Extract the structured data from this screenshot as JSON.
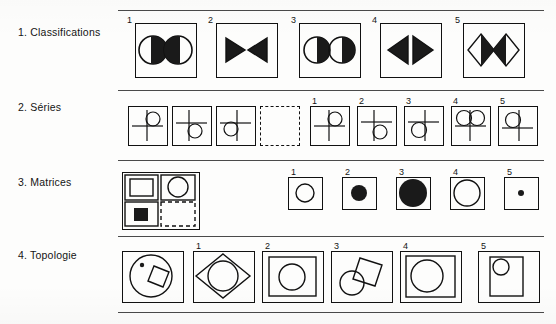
{
  "page": {
    "background_color": "#fdfdfc",
    "ink_color": "#111111",
    "fill_color": "#1a1a1a"
  },
  "rows": [
    {
      "id": "classifications",
      "label": "1. Classifications",
      "stimulus": null,
      "option_numbers": [
        "1",
        "2",
        "3",
        "4",
        "5"
      ],
      "options": [
        {
          "number": "1",
          "description": "two circles, left half-filled on right side, right half-filled on left side (mirror)",
          "shape": "circle",
          "arrangement": "mirror"
        },
        {
          "number": "2",
          "description": "two filled triangles pointing toward each other",
          "shape": "triangle",
          "arrangement": "mirror"
        },
        {
          "number": "3",
          "description": "two circles both filled on the right half (translation)",
          "shape": "circle",
          "arrangement": "translation"
        },
        {
          "number": "4",
          "description": "two triangles filled, apexes pointing outward",
          "shape": "triangle",
          "arrangement": "mirror-outward"
        },
        {
          "number": "5",
          "description": "two diamonds with opposite halves filled (mirror)",
          "shape": "diamond",
          "arrangement": "mirror"
        }
      ]
    },
    {
      "id": "series",
      "label": "2. Séries",
      "stimulus": {
        "cells": [
          {
            "description": "cross with circle at top-right",
            "position": "top-right"
          },
          {
            "description": "cross with circle at bottom-right",
            "position": "bottom-right"
          },
          {
            "description": "cross with circle at bottom-left",
            "position": "bottom-left"
          },
          {
            "description": "empty dashed cell (missing element)",
            "position": "missing"
          }
        ]
      },
      "option_numbers": [
        "1",
        "2",
        "3",
        "4",
        "5"
      ],
      "options": [
        {
          "number": "1",
          "description": "cross with circle at top-right",
          "position": "top-right"
        },
        {
          "number": "2",
          "description": "cross with circle at bottom-right",
          "position": "bottom-right"
        },
        {
          "number": "3",
          "description": "cross with circle at bottom-left",
          "position": "bottom-left"
        },
        {
          "number": "4",
          "description": "cross with two circles on top row",
          "position": "two-top"
        },
        {
          "number": "5",
          "description": "cross with circle at top-left",
          "position": "top-left"
        }
      ]
    },
    {
      "id": "matrices",
      "label": "3. Matrices",
      "stimulus": {
        "cells": [
          {
            "description": "outlined square",
            "position": "top-left"
          },
          {
            "description": "outlined circle",
            "position": "top-right"
          },
          {
            "description": "filled square",
            "position": "bottom-left"
          },
          {
            "description": "empty dashed cell (missing element)",
            "position": "bottom-right"
          }
        ]
      },
      "option_numbers": [
        "1",
        "2",
        "3",
        "4",
        "5"
      ],
      "options": [
        {
          "number": "1",
          "description": "medium outlined circle",
          "size": "medium",
          "fill": "none"
        },
        {
          "number": "2",
          "description": "small filled circle",
          "size": "small",
          "fill": "solid"
        },
        {
          "number": "3",
          "description": "large filled circle",
          "size": "large",
          "fill": "solid"
        },
        {
          "number": "4",
          "description": "large outlined circle",
          "size": "large",
          "fill": "none"
        },
        {
          "number": "5",
          "description": "tiny filled dot",
          "size": "tiny",
          "fill": "solid"
        }
      ]
    },
    {
      "id": "topology",
      "label": "4. Topologie",
      "stimulus": {
        "description": "large circle containing a small dot and a tilted square overlapping the circle edge"
      },
      "option_numbers": [
        "1",
        "2",
        "3",
        "4",
        "5"
      ],
      "options": [
        {
          "number": "1",
          "description": "tilted square inscribed with circle inside, corners touching frame"
        },
        {
          "number": "2",
          "description": "inner square frame containing a circle"
        },
        {
          "number": "3",
          "description": "tilted square overlapping a circle at lower-left"
        },
        {
          "number": "4",
          "description": "inner square frame containing a large circle"
        },
        {
          "number": "5",
          "description": "tall inner rectangle with a small circle at top-left"
        }
      ]
    }
  ]
}
